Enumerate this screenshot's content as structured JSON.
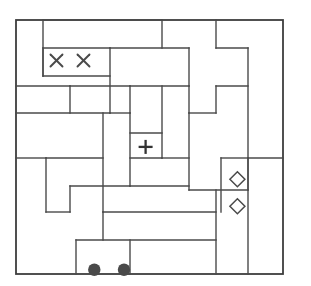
{
  "puzzle": {
    "title": "rectangle-partition-puzzle",
    "background_color": "#ffffff",
    "line_color": "#4a4a4a",
    "border_color": "#3d3d3d",
    "symbol_color": "#4a4a4a",
    "grid": {
      "origin_x": 16,
      "origin_y": 20,
      "cell_size": 27,
      "cols": 10,
      "rows": 9.4
    },
    "symbols": [
      {
        "name": "x-mark",
        "glyph": "×",
        "col": 1,
        "row": 1
      },
      {
        "name": "x-mark",
        "glyph": "×",
        "col": 2,
        "row": 1
      },
      {
        "name": "plus-mark",
        "glyph": "+",
        "col": 4.3,
        "row": 4.2
      },
      {
        "name": "diamond-mark",
        "glyph": "◇",
        "col": 7.7,
        "row": 5.4
      },
      {
        "name": "diamond-mark",
        "glyph": "◇",
        "col": 7.7,
        "row": 6.4
      },
      {
        "name": "dot-mark",
        "glyph": "●",
        "col": 2.4,
        "row": 8.75
      },
      {
        "name": "dot-mark",
        "glyph": "●",
        "col": 3.5,
        "row": 8.75
      }
    ],
    "border": {
      "x": 16,
      "y": 20,
      "width": 267,
      "height": 254
    },
    "segments": [
      {
        "name": "v-seg",
        "x1": 43,
        "y1": 20,
        "x2": 43,
        "y2": 76
      },
      {
        "name": "h-seg",
        "x1": 43,
        "y1": 48,
        "x2": 110,
        "y2": 48
      },
      {
        "name": "h-seg",
        "x1": 43,
        "y1": 76,
        "x2": 110,
        "y2": 76
      },
      {
        "name": "v-seg",
        "x1": 110,
        "y1": 48,
        "x2": 110,
        "y2": 113
      },
      {
        "name": "h-seg",
        "x1": 43,
        "y1": 48,
        "x2": 43,
        "y2": 76
      },
      {
        "name": "h-seg",
        "x1": 16,
        "y1": 113,
        "x2": 110,
        "y2": 113
      },
      {
        "name": "h-seg",
        "x1": 110,
        "y1": 113,
        "x2": 130,
        "y2": 113
      },
      {
        "name": "h-seg",
        "x1": 43,
        "y1": 20,
        "x2": 162,
        "y2": 20
      },
      {
        "name": "v-seg",
        "x1": 162,
        "y1": 20,
        "x2": 162,
        "y2": 48
      },
      {
        "name": "h-seg",
        "x1": 110,
        "y1": 48,
        "x2": 189,
        "y2": 48
      },
      {
        "name": "v-seg",
        "x1": 189,
        "y1": 48,
        "x2": 189,
        "y2": 86
      },
      {
        "name": "h-seg",
        "x1": 130,
        "y1": 86,
        "x2": 189,
        "y2": 86
      },
      {
        "name": "v-seg",
        "x1": 130,
        "y1": 86,
        "x2": 130,
        "y2": 113
      },
      {
        "name": "v-seg",
        "x1": 216,
        "y1": 20,
        "x2": 216,
        "y2": 48
      },
      {
        "name": "h-seg",
        "x1": 216,
        "y1": 48,
        "x2": 248,
        "y2": 48
      },
      {
        "name": "v-seg",
        "x1": 248,
        "y1": 48,
        "x2": 248,
        "y2": 190
      },
      {
        "name": "h-seg",
        "x1": 216,
        "y1": 86,
        "x2": 248,
        "y2": 86
      },
      {
        "name": "v-seg",
        "x1": 216,
        "y1": 86,
        "x2": 216,
        "y2": 113
      },
      {
        "name": "h-seg",
        "x1": 189,
        "y1": 113,
        "x2": 216,
        "y2": 113
      },
      {
        "name": "v-seg",
        "x1": 189,
        "y1": 86,
        "x2": 189,
        "y2": 113
      },
      {
        "name": "h-seg",
        "x1": 70,
        "y1": 86,
        "x2": 130,
        "y2": 86
      },
      {
        "name": "v-seg",
        "x1": 70,
        "y1": 86,
        "x2": 70,
        "y2": 113
      },
      {
        "name": "v-seg",
        "x1": 162,
        "y1": 86,
        "x2": 162,
        "y2": 158
      },
      {
        "name": "h-seg",
        "x1": 162,
        "y1": 158,
        "x2": 189,
        "y2": 158
      },
      {
        "name": "v-seg",
        "x1": 189,
        "y1": 113,
        "x2": 189,
        "y2": 190
      },
      {
        "name": "h-seg",
        "x1": 130,
        "y1": 133,
        "x2": 162,
        "y2": 133
      },
      {
        "name": "v-seg",
        "x1": 130,
        "y1": 113,
        "x2": 130,
        "y2": 186
      },
      {
        "name": "h-seg",
        "x1": 130,
        "y1": 158,
        "x2": 162,
        "y2": 158
      },
      {
        "name": "v-seg",
        "x1": 103,
        "y1": 113,
        "x2": 103,
        "y2": 212
      },
      {
        "name": "h-seg",
        "x1": 16,
        "y1": 158,
        "x2": 46,
        "y2": 158
      },
      {
        "name": "v-seg",
        "x1": 46,
        "y1": 158,
        "x2": 46,
        "y2": 212
      },
      {
        "name": "h-seg",
        "x1": 46,
        "y1": 158,
        "x2": 103,
        "y2": 158
      },
      {
        "name": "h-seg",
        "x1": 46,
        "y1": 212,
        "x2": 70,
        "y2": 212
      },
      {
        "name": "v-seg",
        "x1": 70,
        "y1": 186,
        "x2": 70,
        "y2": 212
      },
      {
        "name": "h-seg",
        "x1": 70,
        "y1": 186,
        "x2": 130,
        "y2": 186
      },
      {
        "name": "h-seg",
        "x1": 130,
        "y1": 186,
        "x2": 189,
        "y2": 186
      },
      {
        "name": "h-seg",
        "x1": 103,
        "y1": 212,
        "x2": 216,
        "y2": 212
      },
      {
        "name": "v-seg",
        "x1": 103,
        "y1": 212,
        "x2": 103,
        "y2": 240
      },
      {
        "name": "h-seg",
        "x1": 76,
        "y1": 240,
        "x2": 216,
        "y2": 240
      },
      {
        "name": "v-seg",
        "x1": 76,
        "y1": 240,
        "x2": 76,
        "y2": 274
      },
      {
        "name": "v-seg",
        "x1": 130,
        "y1": 240,
        "x2": 130,
        "y2": 274
      },
      {
        "name": "v-seg",
        "x1": 216,
        "y1": 190,
        "x2": 216,
        "y2": 274
      },
      {
        "name": "h-seg",
        "x1": 189,
        "y1": 190,
        "x2": 248,
        "y2": 190
      },
      {
        "name": "v-seg",
        "x1": 221,
        "y1": 158,
        "x2": 221,
        "y2": 212
      },
      {
        "name": "h-seg",
        "x1": 221,
        "y1": 158,
        "x2": 248,
        "y2": 158
      },
      {
        "name": "h-seg",
        "x1": 248,
        "y1": 158,
        "x2": 283,
        "y2": 158
      },
      {
        "name": "v-seg",
        "x1": 248,
        "y1": 158,
        "x2": 248,
        "y2": 274
      },
      {
        "name": "h-seg",
        "x1": 16,
        "y1": 86,
        "x2": 70,
        "y2": 86
      }
    ]
  }
}
